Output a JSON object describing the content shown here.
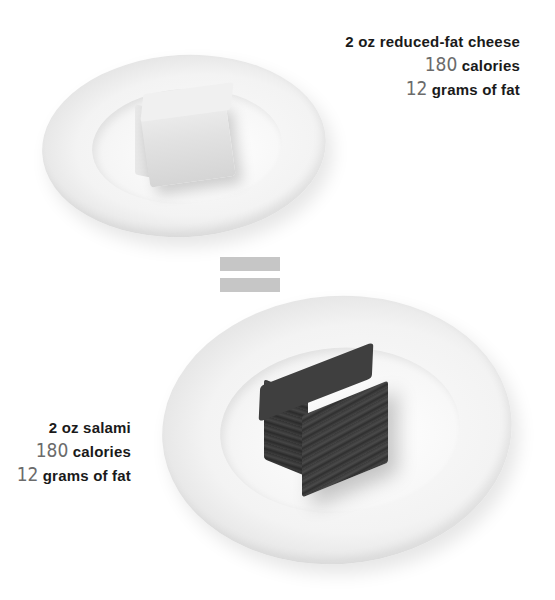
{
  "comparison": {
    "top_item": {
      "name_line": "2 oz reduced-fat cheese",
      "calories_value": "180",
      "calories_label": " calories",
      "fat_value": "12",
      "fat_label": " grams of fat",
      "food_color": "#e6e6e6"
    },
    "equals_symbol": "=",
    "bottom_item": {
      "name_line": "2 oz salami",
      "calories_value": "180",
      "calories_label": " calories",
      "fat_value": "12",
      "fat_label": " grams of fat",
      "food_color": "#3c3c3c"
    },
    "colors": {
      "label_text": "#1a1a1a",
      "number_text": "#6b6b6b",
      "equals_bars": "#c6c6c6",
      "background": "#ffffff"
    }
  }
}
